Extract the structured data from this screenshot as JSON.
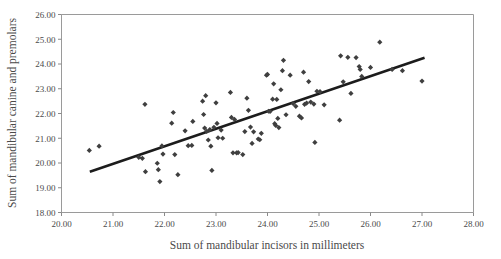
{
  "chart_data": {
    "type": "scatter",
    "title": "",
    "xlabel": "Sum of mandibular incisors in millimeters",
    "ylabel": "Sum of mandibular canine and premolars",
    "xlim": [
      20.0,
      28.0
    ],
    "ylim": [
      18.0,
      26.0
    ],
    "xticks": [
      20.0,
      21.0,
      22.0,
      23.0,
      24.0,
      25.0,
      26.0,
      27.0,
      28.0
    ],
    "yticks": [
      18.0,
      19.0,
      20.0,
      21.0,
      22.0,
      23.0,
      24.0,
      25.0,
      26.0
    ],
    "xtick_labels": [
      "20.00",
      "21.00",
      "22.00",
      "23.00",
      "24.00",
      "25.00",
      "26.00",
      "27.00",
      "28.00"
    ],
    "ytick_labels": [
      "18.00",
      "19.00",
      "20.00",
      "21.00",
      "22.00",
      "23.00",
      "24.00",
      "25.00",
      "26.00"
    ],
    "grid": false,
    "legend": null,
    "marker_shape": "diamond",
    "marker_color": "#3f3f3f",
    "frame_color": "#9a9a9a",
    "fit_line": {
      "type": "linear-regression",
      "color": "#1c1c1c",
      "x_start": 20.55,
      "y_start": 19.65,
      "x_end": 27.05,
      "y_end": 24.25
    },
    "points": [
      [
        20.54,
        20.51
      ],
      [
        20.73,
        20.68
      ],
      [
        21.5,
        20.23
      ],
      [
        21.57,
        20.19
      ],
      [
        21.62,
        22.37
      ],
      [
        21.63,
        19.65
      ],
      [
        21.86,
        19.99
      ],
      [
        21.88,
        19.73
      ],
      [
        21.91,
        19.25
      ],
      [
        21.95,
        20.69
      ],
      [
        21.97,
        20.36
      ],
      [
        22.14,
        21.61
      ],
      [
        22.17,
        22.04
      ],
      [
        22.2,
        20.34
      ],
      [
        22.26,
        19.53
      ],
      [
        22.4,
        21.3
      ],
      [
        22.46,
        20.7
      ],
      [
        22.53,
        20.71
      ],
      [
        22.55,
        21.68
      ],
      [
        22.74,
        22.5
      ],
      [
        22.76,
        21.96
      ],
      [
        22.78,
        21.41
      ],
      [
        22.8,
        22.72
      ],
      [
        22.82,
        21.28
      ],
      [
        22.85,
        20.93
      ],
      [
        22.88,
        21.35
      ],
      [
        22.9,
        20.68
      ],
      [
        22.92,
        19.7
      ],
      [
        22.96,
        21.44
      ],
      [
        23.0,
        22.43
      ],
      [
        23.02,
        21.6
      ],
      [
        23.04,
        21.02
      ],
      [
        23.1,
        21.33
      ],
      [
        23.13,
        21.0
      ],
      [
        23.28,
        22.85
      ],
      [
        23.3,
        21.84
      ],
      [
        23.33,
        20.41
      ],
      [
        23.36,
        21.76
      ],
      [
        23.4,
        20.41
      ],
      [
        23.43,
        20.42
      ],
      [
        23.52,
        20.34
      ],
      [
        23.56,
        21.27
      ],
      [
        23.6,
        22.62
      ],
      [
        23.63,
        22.13
      ],
      [
        23.67,
        21.45
      ],
      [
        23.7,
        20.79
      ],
      [
        23.73,
        21.26
      ],
      [
        23.82,
        20.97
      ],
      [
        23.85,
        20.94
      ],
      [
        23.88,
        21.2
      ],
      [
        23.98,
        23.55
      ],
      [
        24.0,
        23.58
      ],
      [
        24.02,
        22.09
      ],
      [
        24.05,
        22.08
      ],
      [
        24.1,
        22.58
      ],
      [
        24.12,
        23.2
      ],
      [
        24.14,
        21.59
      ],
      [
        24.16,
        21.52
      ],
      [
        24.18,
        22.57
      ],
      [
        24.2,
        21.8
      ],
      [
        24.22,
        21.43
      ],
      [
        24.26,
        22.96
      ],
      [
        24.29,
        23.73
      ],
      [
        24.31,
        24.15
      ],
      [
        24.36,
        21.95
      ],
      [
        24.44,
        23.55
      ],
      [
        24.5,
        22.4
      ],
      [
        24.55,
        22.29
      ],
      [
        24.62,
        21.89
      ],
      [
        24.66,
        21.82
      ],
      [
        24.7,
        23.67
      ],
      [
        24.72,
        22.37
      ],
      [
        24.76,
        22.42
      ],
      [
        24.8,
        23.29
      ],
      [
        24.84,
        22.46
      ],
      [
        24.9,
        22.38
      ],
      [
        24.92,
        20.83
      ],
      [
        24.96,
        22.9
      ],
      [
        25.02,
        22.88
      ],
      [
        25.1,
        22.35
      ],
      [
        25.4,
        21.73
      ],
      [
        25.42,
        24.33
      ],
      [
        25.47,
        23.28
      ],
      [
        25.56,
        24.27
      ],
      [
        25.62,
        22.81
      ],
      [
        25.72,
        24.26
      ],
      [
        25.78,
        23.9
      ],
      [
        25.8,
        23.78
      ],
      [
        25.83,
        23.5
      ],
      [
        26.0,
        23.86
      ],
      [
        26.18,
        24.88
      ],
      [
        26.42,
        23.78
      ],
      [
        26.62,
        23.73
      ],
      [
        27.0,
        23.31
      ]
    ]
  }
}
